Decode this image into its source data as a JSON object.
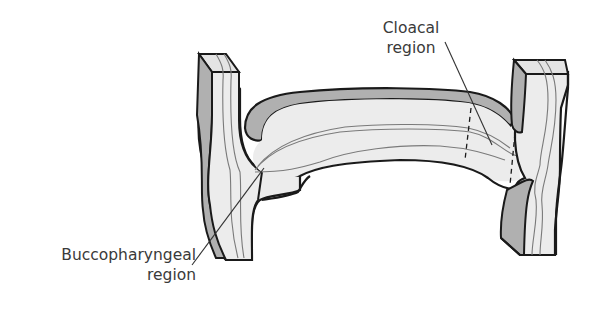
{
  "figure": {
    "colors": {
      "outline": "#1a1a1a",
      "fill_light": "#ececec",
      "fill_shaded": "#b0b0b0",
      "inner_lines": "#7a7a7a",
      "leader_lines": "#333333",
      "label_text": "#3a3a3a",
      "background": "#ffffff"
    }
  },
  "labels": {
    "cloacal": {
      "line1": "Cloacal",
      "line2": "region"
    },
    "buccopharyngeal": {
      "line1": "Buccopharyngeal",
      "line2": "region"
    }
  }
}
